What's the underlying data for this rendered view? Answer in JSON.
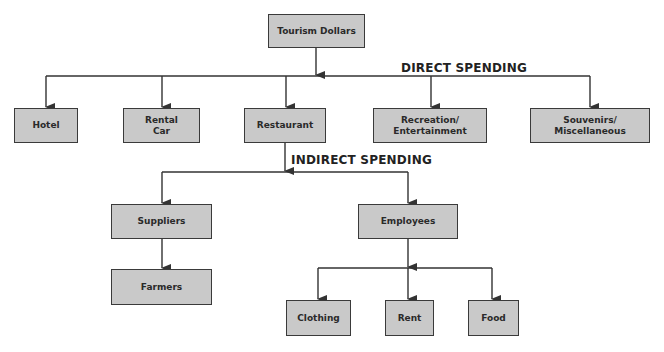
{
  "diagram": {
    "type": "flowchart",
    "root": {
      "id": "tourism",
      "label": "Tourism Dollars"
    },
    "sections": {
      "direct": {
        "label": "DIRECT SPENDING"
      },
      "indirect": {
        "label": "INDIRECT SPENDING"
      }
    },
    "direct_nodes": [
      {
        "id": "hotel",
        "label": "Hotel"
      },
      {
        "id": "rental_car",
        "label": "Rental\nCar"
      },
      {
        "id": "restaurant",
        "label": "Restaurant"
      },
      {
        "id": "recreation",
        "label": "Recreation/\nEntertainment"
      },
      {
        "id": "souvenirs",
        "label": "Souvenirs/\nMiscellaneous"
      }
    ],
    "indirect_nodes": [
      {
        "id": "suppliers",
        "label": "Suppliers"
      },
      {
        "id": "employees",
        "label": "Employees"
      }
    ],
    "supplier_children": [
      {
        "id": "farmers",
        "label": "Farmers"
      }
    ],
    "employee_children": [
      {
        "id": "clothing",
        "label": "Clothing"
      },
      {
        "id": "rent",
        "label": "Rent"
      },
      {
        "id": "food",
        "label": "Food"
      }
    ],
    "edges": [
      [
        "tourism",
        "hotel"
      ],
      [
        "tourism",
        "rental_car"
      ],
      [
        "tourism",
        "restaurant"
      ],
      [
        "tourism",
        "recreation"
      ],
      [
        "tourism",
        "souvenirs"
      ],
      [
        "restaurant",
        "suppliers"
      ],
      [
        "restaurant",
        "employees"
      ],
      [
        "suppliers",
        "farmers"
      ],
      [
        "employees",
        "clothing"
      ],
      [
        "employees",
        "rent"
      ],
      [
        "employees",
        "food"
      ]
    ],
    "colors": {
      "box_fill": "#c9c9c9",
      "box_border": "#3a3a3a",
      "line": "#333333"
    }
  }
}
